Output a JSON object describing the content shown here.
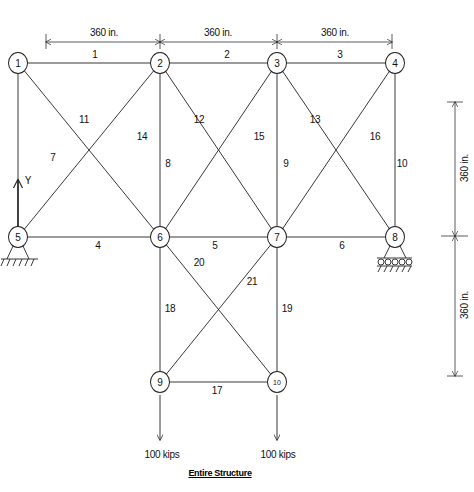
{
  "title": "Entire Structure",
  "dimensions": {
    "horizontal": [
      "360 in.",
      "360 in.",
      "360 in."
    ],
    "vertical": [
      "360 in.",
      "360 in."
    ]
  },
  "axis_label": "Y",
  "nodes": [
    {
      "id": "1",
      "x": 18,
      "y": 63
    },
    {
      "id": "2",
      "x": 160,
      "y": 63
    },
    {
      "id": "3",
      "x": 277,
      "y": 63
    },
    {
      "id": "4",
      "x": 395,
      "y": 63
    },
    {
      "id": "5",
      "x": 18,
      "y": 237
    },
    {
      "id": "6",
      "x": 160,
      "y": 237
    },
    {
      "id": "7",
      "x": 277,
      "y": 237
    },
    {
      "id": "8",
      "x": 395,
      "y": 237
    },
    {
      "id": "9",
      "x": 160,
      "y": 382
    },
    {
      "id": "10",
      "x": 277,
      "y": 382
    }
  ],
  "members": [
    {
      "id": "1",
      "from": "1",
      "to": "2",
      "lx": 95,
      "ly": 55
    },
    {
      "id": "2",
      "from": "2",
      "to": "3",
      "lx": 227,
      "ly": 55
    },
    {
      "id": "3",
      "from": "3",
      "to": "4",
      "lx": 340,
      "ly": 55
    },
    {
      "id": "4",
      "from": "5",
      "to": "6",
      "lx": 98,
      "ly": 246
    },
    {
      "id": "5",
      "from": "6",
      "to": "7",
      "lx": 215,
      "ly": 246
    },
    {
      "id": "6",
      "from": "7",
      "to": "8",
      "lx": 342,
      "ly": 246
    },
    {
      "id": "7",
      "from": "1",
      "to": "5",
      "lx": 53,
      "ly": 158
    },
    {
      "id": "8",
      "from": "2",
      "to": "6",
      "lx": 168,
      "ly": 164
    },
    {
      "id": "9",
      "from": "3",
      "to": "7",
      "lx": 286,
      "ly": 164
    },
    {
      "id": "10",
      "from": "4",
      "to": "8",
      "lx": 402,
      "ly": 164
    },
    {
      "id": "11",
      "from": "1",
      "to": "6",
      "lx": 84,
      "ly": 120
    },
    {
      "id": "12",
      "from": "2",
      "to": "7",
      "lx": 199,
      "ly": 120
    },
    {
      "id": "13",
      "from": "3",
      "to": "8",
      "lx": 315,
      "ly": 120
    },
    {
      "id": "14",
      "from": "5",
      "to": "2",
      "lx": 142,
      "ly": 137
    },
    {
      "id": "15",
      "from": "6",
      "to": "3",
      "lx": 259,
      "ly": 137
    },
    {
      "id": "16",
      "from": "7",
      "to": "4",
      "lx": 375,
      "ly": 137
    },
    {
      "id": "17",
      "from": "9",
      "to": "10",
      "lx": 217,
      "ly": 391
    },
    {
      "id": "18",
      "from": "6",
      "to": "9",
      "lx": 170,
      "ly": 309
    },
    {
      "id": "19",
      "from": "7",
      "to": "10",
      "lx": 287,
      "ly": 309
    },
    {
      "id": "20",
      "from": "6",
      "to": "10",
      "lx": 199,
      "ly": 263
    },
    {
      "id": "21",
      "from": "9",
      "to": "7",
      "lx": 252,
      "ly": 282
    }
  ],
  "supports": [
    {
      "node": "5",
      "type": "pin"
    },
    {
      "node": "8",
      "type": "roller"
    }
  ],
  "loads": [
    {
      "node": "9",
      "label": "100 kips"
    },
    {
      "node": "10",
      "label": "100 kips"
    }
  ]
}
